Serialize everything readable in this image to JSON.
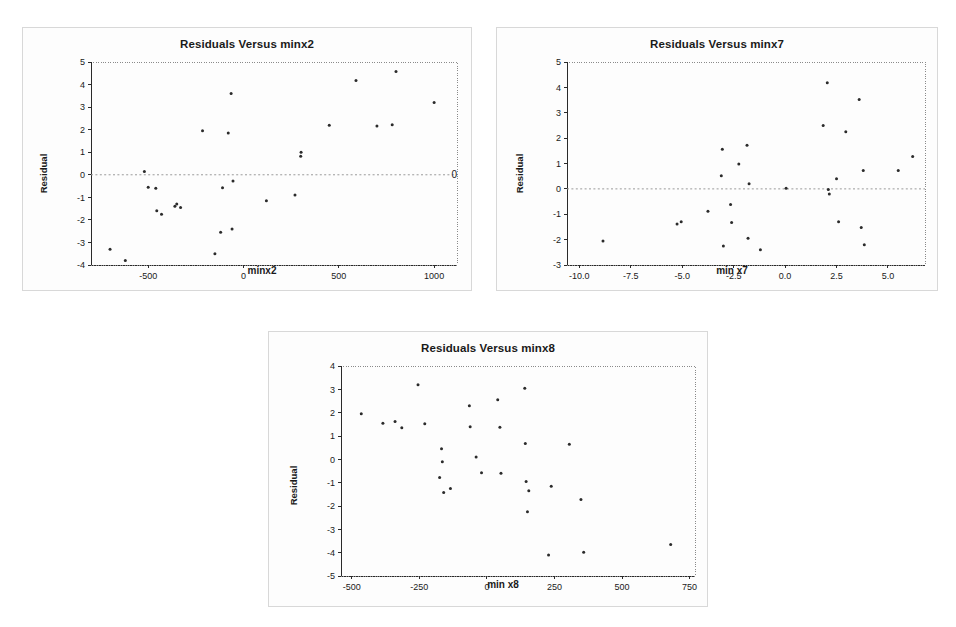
{
  "page": {
    "background": "#ffffff",
    "point_color": "#2b2b2b",
    "axis_color": "#2a2a2a",
    "frame_color": "#8a8a8a",
    "zero_line_color": "#9a9a9a"
  },
  "panels": [
    {
      "id": "minx2",
      "title_key": 0
    },
    {
      "id": "minx7",
      "title_key": 1
    },
    {
      "id": "minx8",
      "title_key": 2
    }
  ],
  "chart_data": [
    {
      "type": "scatter",
      "title": "Residuals Versus minx2",
      "xlabel": "minx2",
      "ylabel": "Residual",
      "right_annotation": "0",
      "xlim": [
        -800,
        1120
      ],
      "ylim": [
        -4,
        5
      ],
      "xticks": [
        -500,
        0,
        500,
        1000
      ],
      "xticklabels": [
        "-500",
        "0",
        "500",
        "1000"
      ],
      "yticks": [
        -4,
        -3,
        -2,
        -1,
        0,
        1,
        2,
        3,
        4,
        5
      ],
      "yticklabels": [
        "-4",
        "-3",
        "-2",
        "-1",
        "0",
        "1",
        "2",
        "3",
        "4",
        "5"
      ],
      "grid": false,
      "zero_reference_line": 0,
      "points": [
        {
          "x": -700,
          "y": -3.3
        },
        {
          "x": -620,
          "y": -3.8
        },
        {
          "x": -520,
          "y": 0.15
        },
        {
          "x": -500,
          "y": -0.55
        },
        {
          "x": -460,
          "y": -0.6
        },
        {
          "x": -455,
          "y": -1.6
        },
        {
          "x": -430,
          "y": -1.75
        },
        {
          "x": -360,
          "y": -1.4
        },
        {
          "x": -350,
          "y": -1.3
        },
        {
          "x": -330,
          "y": -1.45
        },
        {
          "x": -215,
          "y": 1.95
        },
        {
          "x": -150,
          "y": -3.5
        },
        {
          "x": -120,
          "y": -2.55
        },
        {
          "x": -110,
          "y": -0.58
        },
        {
          "x": -80,
          "y": 1.85
        },
        {
          "x": -65,
          "y": 3.6
        },
        {
          "x": -60,
          "y": -2.4
        },
        {
          "x": -55,
          "y": -0.28
        },
        {
          "x": 120,
          "y": -1.15
        },
        {
          "x": 270,
          "y": -0.9
        },
        {
          "x": 300,
          "y": 0.82
        },
        {
          "x": 302,
          "y": 1.0
        },
        {
          "x": 450,
          "y": 2.2
        },
        {
          "x": 590,
          "y": 4.18
        },
        {
          "x": 700,
          "y": 2.16
        },
        {
          "x": 780,
          "y": 2.22
        },
        {
          "x": 800,
          "y": 4.58
        },
        {
          "x": 1000,
          "y": 3.2
        }
      ]
    },
    {
      "type": "scatter",
      "title": "Residuals Versus minx7",
      "xlabel": "min x7",
      "ylabel": "Residual",
      "right_annotation": "",
      "xlim": [
        -10.6,
        6.8
      ],
      "ylim": [
        -3,
        5
      ],
      "xticks": [
        -10.0,
        -7.5,
        -5.0,
        -2.5,
        0.0,
        2.5,
        5.0
      ],
      "xticklabels": [
        "-10.0",
        "-7.5",
        "-5.0",
        "-2.5",
        "0.0",
        "2.5",
        "5.0"
      ],
      "yticks": [
        -3,
        -2,
        -1,
        0,
        1,
        2,
        3,
        4,
        5
      ],
      "yticklabels": [
        "-3",
        "-2",
        "-1",
        "0",
        "1",
        "2",
        "3",
        "4",
        "5"
      ],
      "grid": false,
      "zero_reference_line": 0,
      "points": [
        {
          "x": -8.85,
          "y": -2.05
        },
        {
          "x": -5.25,
          "y": -1.38
        },
        {
          "x": -5.05,
          "y": -1.3
        },
        {
          "x": -3.75,
          "y": -0.88
        },
        {
          "x": -3.1,
          "y": 0.52
        },
        {
          "x": -3.05,
          "y": 1.56
        },
        {
          "x": -3.0,
          "y": -2.25
        },
        {
          "x": -2.65,
          "y": -0.62
        },
        {
          "x": -2.6,
          "y": -1.33
        },
        {
          "x": -2.25,
          "y": 0.98
        },
        {
          "x": -1.85,
          "y": 1.72
        },
        {
          "x": -1.8,
          "y": -1.95
        },
        {
          "x": -1.75,
          "y": 0.2
        },
        {
          "x": -1.2,
          "y": -2.4
        },
        {
          "x": 0.05,
          "y": 0.02
        },
        {
          "x": 1.85,
          "y": 2.5
        },
        {
          "x": 2.05,
          "y": 4.18
        },
        {
          "x": 2.1,
          "y": -0.02
        },
        {
          "x": 2.15,
          "y": -0.2
        },
        {
          "x": 2.5,
          "y": 0.4
        },
        {
          "x": 2.6,
          "y": -1.3
        },
        {
          "x": 2.95,
          "y": 2.25
        },
        {
          "x": 3.6,
          "y": 3.52
        },
        {
          "x": 3.7,
          "y": -1.52
        },
        {
          "x": 3.8,
          "y": 0.72
        },
        {
          "x": 3.85,
          "y": -2.2
        },
        {
          "x": 5.5,
          "y": 0.72
        },
        {
          "x": 6.2,
          "y": 1.28
        }
      ]
    },
    {
      "type": "scatter",
      "title": "Residuals Versus minx8",
      "xlabel": "min x8",
      "ylabel": "Residual",
      "right_annotation": "",
      "xlim": [
        -540,
        770
      ],
      "ylim": [
        -5,
        4
      ],
      "xticks": [
        -500,
        -250,
        0,
        250,
        500,
        750
      ],
      "xticklabels": [
        "-500",
        "-250",
        "0",
        "250",
        "500",
        "750"
      ],
      "yticks": [
        -5,
        -4,
        -3,
        -2,
        -1,
        0,
        1,
        2,
        3,
        4
      ],
      "yticklabels": [
        "-5",
        "-4",
        "-3",
        "-2",
        "-1",
        "0",
        "1",
        "2",
        "3",
        "4"
      ],
      "grid": false,
      "zero_reference_line": null,
      "points": [
        {
          "x": -465,
          "y": 1.95
        },
        {
          "x": -385,
          "y": 1.55
        },
        {
          "x": -340,
          "y": 1.62
        },
        {
          "x": -315,
          "y": 1.35
        },
        {
          "x": -255,
          "y": 3.2
        },
        {
          "x": -230,
          "y": 1.52
        },
        {
          "x": -175,
          "y": -0.78
        },
        {
          "x": -168,
          "y": 0.45
        },
        {
          "x": -165,
          "y": -0.1
        },
        {
          "x": -160,
          "y": -1.42
        },
        {
          "x": -135,
          "y": -1.25
        },
        {
          "x": -65,
          "y": 2.3
        },
        {
          "x": -62,
          "y": 1.4
        },
        {
          "x": -40,
          "y": 0.1
        },
        {
          "x": -20,
          "y": -0.58
        },
        {
          "x": 40,
          "y": 2.55
        },
        {
          "x": 48,
          "y": 1.38
        },
        {
          "x": 52,
          "y": -0.6
        },
        {
          "x": 140,
          "y": 3.05
        },
        {
          "x": 142,
          "y": 0.68
        },
        {
          "x": 145,
          "y": -0.95
        },
        {
          "x": 150,
          "y": -2.25
        },
        {
          "x": 155,
          "y": -1.35
        },
        {
          "x": 228,
          "y": -4.1
        },
        {
          "x": 238,
          "y": -1.15
        },
        {
          "x": 305,
          "y": 0.65
        },
        {
          "x": 348,
          "y": -1.72
        },
        {
          "x": 358,
          "y": -3.98
        },
        {
          "x": 680,
          "y": -3.65
        }
      ]
    }
  ]
}
